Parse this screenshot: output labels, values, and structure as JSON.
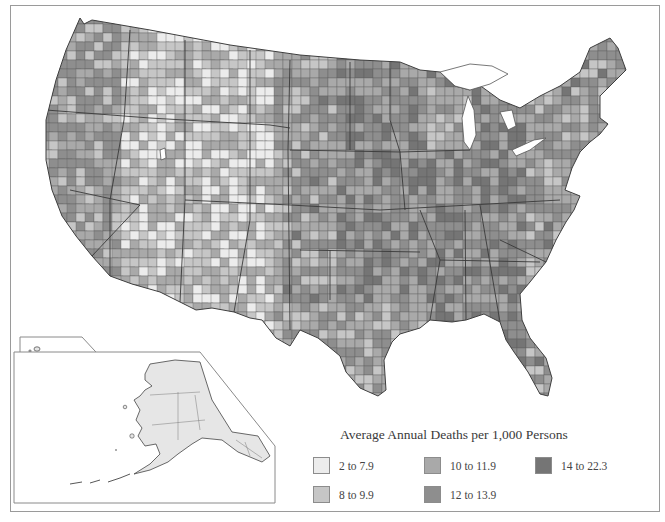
{
  "map": {
    "type": "choropleth",
    "subject": "Average Annual Deaths per 1,000 Persons",
    "region": "United States counties (with Alaska and Hawaii insets)",
    "insets": [
      "Hawaii",
      "Alaska"
    ]
  },
  "legend": {
    "title": "Average Annual Deaths per 1,000 Persons",
    "items": [
      {
        "label": "2 to 7.9",
        "color": "#ececec"
      },
      {
        "label": "8 to 9.9",
        "color": "#c6c6c6"
      },
      {
        "label": "10 to 11.9",
        "color": "#a9a9a9"
      },
      {
        "label": "12 to 13.9",
        "color": "#8e8e8e"
      },
      {
        "label": "14 to 22.3",
        "color": "#757575"
      }
    ]
  },
  "colors": {
    "frame": "#9a9a9a",
    "boundary": "#4a4a4a",
    "alaska_fill": "#e6e6e6",
    "hawaii_big_island": "#a9a9a9"
  }
}
